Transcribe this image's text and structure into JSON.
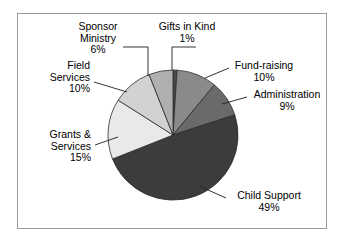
{
  "chart_data": {
    "type": "pie",
    "title": "",
    "subtitle": "",
    "xlabel": "",
    "ylabel": "",
    "legend_position": "none",
    "grid": false,
    "labels_placement": "external-with-leader-lines",
    "total_percent": 100,
    "categories": [
      "Gifts in Kind",
      "Fund-raising",
      "Administration",
      "Child Support",
      "Grants & Services",
      "Field Services",
      "Sponsor Ministry"
    ],
    "values": [
      1,
      10,
      9,
      49,
      15,
      10,
      6
    ],
    "slice_colors": [
      "#4a4a4a",
      "#8a8a8a",
      "#6a6a6a",
      "#3c3c3c",
      "#e9e9e9",
      "#d2d2d2",
      "#b0b0b0"
    ],
    "slices": [
      {
        "label": "Gifts in Kind",
        "value": 1,
        "value_text": "1%",
        "color": "#4a4a4a"
      },
      {
        "label": "Fund-raising",
        "value": 10,
        "value_text": "10%",
        "color": "#8a8a8a"
      },
      {
        "label": "Administration",
        "value": 9,
        "value_text": "9%",
        "color": "#6a6a6a"
      },
      {
        "label": "Child Support",
        "value": 49,
        "value_text": "49%",
        "color": "#3c3c3c"
      },
      {
        "label": "Grants & Services",
        "value": 15,
        "value_text": "15%",
        "color": "#e9e9e9"
      },
      {
        "label": "Field Services",
        "value": 10,
        "value_text": "10%",
        "color": "#d2d2d2"
      },
      {
        "label": "Sponsor Ministry",
        "value": 6,
        "value_text": "6%",
        "color": "#b0b0b0"
      }
    ]
  },
  "labels": {
    "sponsor_ministry": {
      "line1": "Sponsor",
      "line2": "Ministry",
      "value": "6%"
    },
    "gifts_in_kind": {
      "line1": "Gifts in Kind",
      "value": "1%"
    },
    "fund_raising": {
      "line1": "Fund-raising",
      "value": "10%"
    },
    "administration": {
      "line1": "Administration",
      "value": "9%"
    },
    "child_support": {
      "line1": "Child Support",
      "value": "49%"
    },
    "grants_services": {
      "line1": "Grants &",
      "line2": "Services",
      "value": "15%"
    },
    "field_services": {
      "line1": "Field",
      "line2": "Services",
      "value": "10%"
    }
  },
  "style": {
    "frame_border_color": "#9a9a9a",
    "background": "#ffffff",
    "slice_outline": "#2b2b2b",
    "leader_line_color": "#1e1e1e",
    "text_color": "#000000"
  }
}
